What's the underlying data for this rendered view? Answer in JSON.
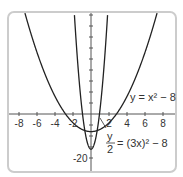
{
  "chart_data": {
    "type": "line",
    "title": "",
    "xlabel": "",
    "ylabel": "",
    "xlim": [
      -9.5,
      9.5
    ],
    "ylim": [
      -22,
      52
    ],
    "x_ticks": [
      -8,
      -6,
      -4,
      -2,
      2,
      4,
      6,
      8
    ],
    "x_tick_labels": [
      "-8",
      "-6",
      "-4",
      "-2",
      "2",
      "4",
      "6",
      "8"
    ],
    "y_tick_labels": [
      "-20"
    ],
    "grid": false,
    "series": [
      {
        "name": "y = x^2 - 8",
        "formula": "x^2 - 8"
      },
      {
        "name": "y/2 = (3x)^2 - 8",
        "formula": "2*(9x^2 - 8)"
      }
    ]
  },
  "labels": {
    "curve1": "y = x² − 8",
    "curve2_num": "y",
    "curve2_den": "2",
    "curve2_rhs": "= (3x)² − 8",
    "y_tick": "-20"
  }
}
